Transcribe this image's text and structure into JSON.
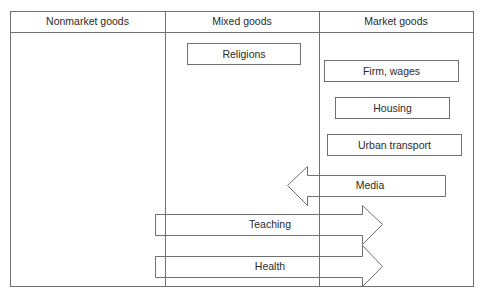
{
  "columns": [
    {
      "label": "Nonmarket goods"
    },
    {
      "label": "Mixed goods"
    },
    {
      "label": "Market goods"
    }
  ],
  "boxes": [
    {
      "label": "Religions"
    },
    {
      "label": "Firm, wages"
    },
    {
      "label": "Housing"
    },
    {
      "label": "Urban transport"
    }
  ],
  "arrows": [
    {
      "label": "Media",
      "direction": "left"
    },
    {
      "label": "Teaching",
      "direction": "right"
    },
    {
      "label": "Health",
      "direction": "right"
    }
  ],
  "colors": {
    "line": "#6f6f6f",
    "text": "#2a2a2a",
    "background": "#ffffff"
  }
}
